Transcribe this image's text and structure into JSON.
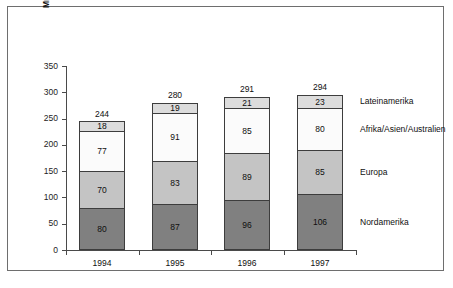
{
  "chart_data": {
    "type": "bar",
    "subtype": "stacked-bar",
    "title": "",
    "xlabel": "",
    "ylabel": "Mrd US$",
    "ylim": [
      0,
      350
    ],
    "yticks": [
      0,
      50,
      100,
      150,
      200,
      250,
      300,
      350
    ],
    "ytick_labels": [
      "0",
      "50",
      "100",
      "150",
      "200",
      "250",
      "300",
      "350"
    ],
    "grid": false,
    "legend_position": "right",
    "categories": [
      "1994",
      "1995",
      "1996",
      "1997"
    ],
    "series": [
      {
        "name": "Nordamerika",
        "values": [
          80,
          87,
          96,
          106
        ],
        "color": "#808080"
      },
      {
        "name": "Europa",
        "values": [
          70,
          83,
          89,
          85
        ],
        "color": "#c4c4c4"
      },
      {
        "name": "Afrika/Asien/Australien",
        "values": [
          77,
          91,
          85,
          80
        ],
        "color": "#fbfbfb"
      },
      {
        "name": "Lateinamerika",
        "values": [
          18,
          19,
          21,
          23
        ],
        "color": "#dcdcdc"
      }
    ],
    "totals": [
      244,
      280,
      291,
      294
    ],
    "total_labels": [
      "244",
      "280",
      "291",
      "294"
    ],
    "segment_labels": {
      "1994": [
        "80",
        "70",
        "77",
        "18"
      ],
      "1995": [
        "87",
        "83",
        "91",
        "19"
      ],
      "1996": [
        "96",
        "89",
        "85",
        "21"
      ],
      "1997": [
        "106",
        "85",
        "80",
        "23"
      ]
    }
  },
  "axis": {
    "y_title": "Mrd US$"
  },
  "legend": {
    "items": [
      {
        "label": "Lateinamerika"
      },
      {
        "label": "Afrika/Asien/Australien"
      },
      {
        "label": "Europa"
      },
      {
        "label": "Nordamerika"
      }
    ]
  },
  "colors": {
    "nordamerika": "#808080",
    "europa": "#c4c4c4",
    "afrika_asien_australien": "#fbfbfb",
    "lateinamerika": "#dcdcdc",
    "axis": "#4a4a4a",
    "frame": "#6e6e6e",
    "text": "#0f0f0f"
  }
}
